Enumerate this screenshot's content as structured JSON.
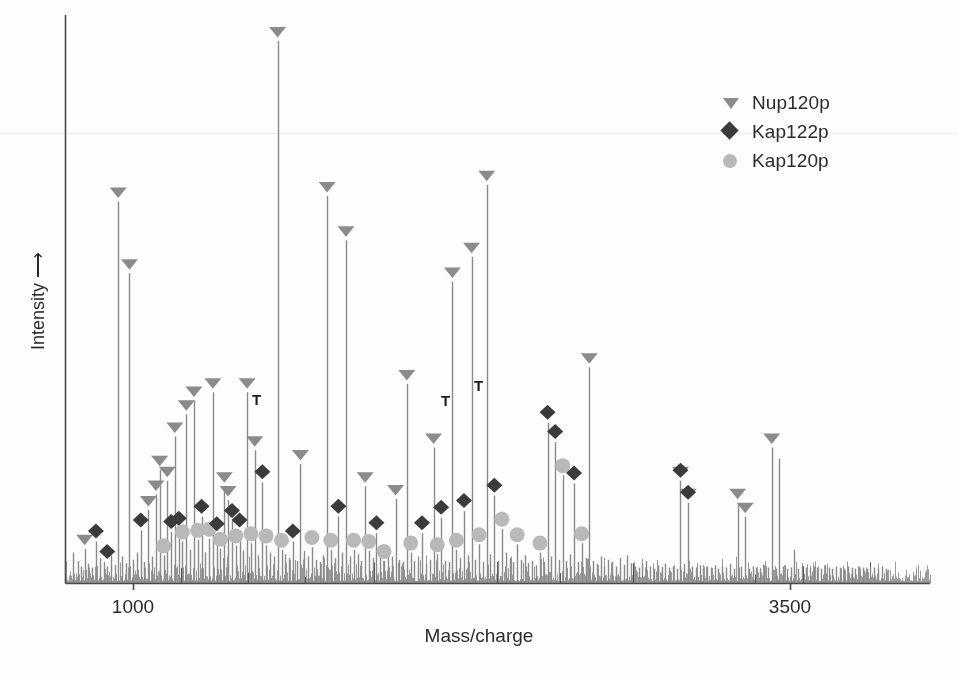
{
  "figure": {
    "background": "#fdfdfc",
    "axis_color": "#4a4a4a",
    "xlabel": "Mass/charge",
    "ylabel": "Intensity ⟶",
    "xticks": [
      {
        "label": "1000",
        "px": 133
      },
      {
        "label": "3500",
        "px": 790
      }
    ]
  },
  "legend": {
    "position": "top-right",
    "items": [
      {
        "label": "Nup120p",
        "marker": "triangle-down-icon",
        "color": "#8b8b8b"
      },
      {
        "label": "Kap122p",
        "marker": "diamond-icon",
        "color": "#3b3b3b"
      },
      {
        "label": "Kap120p",
        "marker": "circle-icon",
        "color": "#b9b9b9"
      }
    ]
  },
  "annotations": {
    "label": "T",
    "items": [
      {
        "text": "T",
        "x": 256,
        "y": 398
      },
      {
        "text": "T",
        "x": 445,
        "y": 399
      },
      {
        "text": "T",
        "x": 478,
        "y": 384
      }
    ]
  },
  "chart_data": {
    "type": "line",
    "title": "",
    "subtitle": "",
    "xlabel": "Mass/charge",
    "ylabel": "Intensity",
    "xlim": [
      800,
      4100
    ],
    "ylim": [
      0,
      1.0
    ],
    "grid": false,
    "legend_position": "top-right",
    "xtick_values": [
      1000,
      3500
    ],
    "xtick_labels": [
      "1000",
      "3500"
    ],
    "ytick_values": [],
    "series": [
      {
        "name": "spectrum",
        "color": "#8a8a8a",
        "note": "peaks given as [mass_charge, relative_intensity 0-1]",
        "peaks": [
          [
            830,
            0.055
          ],
          [
            848,
            0.04
          ],
          [
            862,
            0.03
          ],
          [
            875,
            0.062
          ],
          [
            889,
            0.035
          ],
          [
            903,
            0.028
          ],
          [
            918,
            0.075
          ],
          [
            932,
            0.045
          ],
          [
            947,
            0.038
          ],
          [
            961,
            0.03
          ],
          [
            975,
            0.05
          ],
          [
            990,
            0.033
          ],
          [
            1003,
            0.69
          ],
          [
            1018,
            0.048
          ],
          [
            1032,
            0.036
          ],
          [
            1046,
            0.56
          ],
          [
            1060,
            0.042
          ],
          [
            1075,
            0.055
          ],
          [
            1089,
            0.095
          ],
          [
            1103,
            0.038
          ],
          [
            1118,
            0.132
          ],
          [
            1132,
            0.048
          ],
          [
            1147,
            0.16
          ],
          [
            1161,
            0.205
          ],
          [
            1176,
            0.05
          ],
          [
            1190,
            0.185
          ],
          [
            1205,
            0.092
          ],
          [
            1219,
            0.265
          ],
          [
            1234,
            0.098
          ],
          [
            1248,
            0.075
          ],
          [
            1263,
            0.305
          ],
          [
            1277,
            0.06
          ],
          [
            1292,
            0.33
          ],
          [
            1306,
            0.078
          ],
          [
            1321,
            0.12
          ],
          [
            1335,
            0.055
          ],
          [
            1350,
            0.08
          ],
          [
            1364,
            0.345
          ],
          [
            1379,
            0.088
          ],
          [
            1393,
            0.062
          ],
          [
            1408,
            0.175
          ],
          [
            1422,
            0.15
          ],
          [
            1437,
            0.112
          ],
          [
            1451,
            0.068
          ],
          [
            1466,
            0.095
          ],
          [
            1480,
            0.058
          ],
          [
            1495,
            0.345
          ],
          [
            1509,
            0.072
          ],
          [
            1524,
            0.24
          ],
          [
            1538,
            0.05
          ],
          [
            1553,
            0.182
          ],
          [
            1567,
            0.068
          ],
          [
            1582,
            0.055
          ],
          [
            1596,
            0.048
          ],
          [
            1611,
            0.98
          ],
          [
            1626,
            0.06
          ],
          [
            1640,
            0.052
          ],
          [
            1655,
            0.045
          ],
          [
            1669,
            0.075
          ],
          [
            1684,
            0.04
          ],
          [
            1698,
            0.215
          ],
          [
            1713,
            0.058
          ],
          [
            1727,
            0.048
          ],
          [
            1742,
            0.065
          ],
          [
            1756,
            0.042
          ],
          [
            1771,
            0.038
          ],
          [
            1785,
            0.05
          ],
          [
            1800,
            0.7
          ],
          [
            1814,
            0.06
          ],
          [
            1829,
            0.045
          ],
          [
            1843,
            0.12
          ],
          [
            1858,
            0.055
          ],
          [
            1872,
            0.62
          ],
          [
            1887,
            0.048
          ],
          [
            1901,
            0.06
          ],
          [
            1916,
            0.052
          ],
          [
            1930,
            0.04
          ],
          [
            1945,
            0.175
          ],
          [
            1959,
            0.058
          ],
          [
            1974,
            0.045
          ],
          [
            1988,
            0.09
          ],
          [
            2003,
            0.05
          ],
          [
            2017,
            0.04
          ],
          [
            2032,
            0.06
          ],
          [
            2046,
            0.048
          ],
          [
            2061,
            0.152
          ],
          [
            2075,
            0.042
          ],
          [
            2090,
            0.038
          ],
          [
            2104,
            0.36
          ],
          [
            2119,
            0.055
          ],
          [
            2133,
            0.04
          ],
          [
            2148,
            0.048
          ],
          [
            2162,
            0.09
          ],
          [
            2177,
            0.035
          ],
          [
            2191,
            0.042
          ],
          [
            2206,
            0.245
          ],
          [
            2220,
            0.052
          ],
          [
            2235,
            0.118
          ],
          [
            2249,
            0.04
          ],
          [
            2264,
            0.038
          ],
          [
            2278,
            0.545
          ],
          [
            2293,
            0.06
          ],
          [
            2307,
            0.045
          ],
          [
            2322,
            0.13
          ],
          [
            2336,
            0.05
          ],
          [
            2351,
            0.59
          ],
          [
            2365,
            0.042
          ],
          [
            2380,
            0.07
          ],
          [
            2394,
            0.038
          ],
          [
            2409,
            0.72
          ],
          [
            2423,
            0.052
          ],
          [
            2438,
            0.158
          ],
          [
            2452,
            0.04
          ],
          [
            2467,
            0.098
          ],
          [
            2481,
            0.055
          ],
          [
            2496,
            0.045
          ],
          [
            2510,
            0.038
          ],
          [
            2525,
            0.07
          ],
          [
            2539,
            0.042
          ],
          [
            2554,
            0.05
          ],
          [
            2568,
            0.036
          ],
          [
            2583,
            0.04
          ],
          [
            2597,
            0.032
          ],
          [
            2612,
            0.055
          ],
          [
            2626,
            0.038
          ],
          [
            2641,
            0.29
          ],
          [
            2655,
            0.048
          ],
          [
            2670,
            0.255
          ],
          [
            2684,
            0.042
          ],
          [
            2699,
            0.195
          ],
          [
            2713,
            0.04
          ],
          [
            2728,
            0.052
          ],
          [
            2742,
            0.18
          ],
          [
            2757,
            0.038
          ],
          [
            2771,
            0.072
          ],
          [
            2786,
            0.045
          ],
          [
            2800,
            0.39
          ],
          [
            2815,
            0.04
          ],
          [
            2829,
            0.035
          ],
          [
            2844,
            0.048
          ],
          [
            2858,
            0.03
          ],
          [
            2873,
            0.042
          ],
          [
            2887,
            0.038
          ],
          [
            2902,
            0.03
          ],
          [
            2916,
            0.045
          ],
          [
            2931,
            0.033
          ],
          [
            2945,
            0.05
          ],
          [
            2960,
            0.036
          ],
          [
            2974,
            0.03
          ],
          [
            2989,
            0.028
          ],
          [
            3003,
            0.035
          ],
          [
            3018,
            0.04
          ],
          [
            3032,
            0.03
          ],
          [
            3047,
            0.026
          ],
          [
            3061,
            0.032
          ],
          [
            3076,
            0.029
          ],
          [
            3090,
            0.035
          ],
          [
            3105,
            0.028
          ],
          [
            3119,
            0.03
          ],
          [
            3134,
            0.026
          ],
          [
            3148,
            0.185
          ],
          [
            3163,
            0.035
          ],
          [
            3177,
            0.145
          ],
          [
            3192,
            0.03
          ],
          [
            3206,
            0.028
          ],
          [
            3221,
            0.032
          ],
          [
            3235,
            0.026
          ],
          [
            3250,
            0.03
          ],
          [
            3264,
            0.028
          ],
          [
            3279,
            0.032
          ],
          [
            3293,
            0.026
          ],
          [
            3308,
            0.03
          ],
          [
            3322,
            0.028
          ],
          [
            3337,
            0.035
          ],
          [
            3351,
            0.026
          ],
          [
            3366,
            0.145
          ],
          [
            3380,
            0.03
          ],
          [
            3395,
            0.12
          ],
          [
            3409,
            0.026
          ],
          [
            3424,
            0.03
          ],
          [
            3438,
            0.028
          ],
          [
            3453,
            0.026
          ],
          [
            3467,
            0.03
          ],
          [
            3482,
            0.028
          ],
          [
            3496,
            0.245
          ],
          [
            3511,
            0.026
          ],
          [
            3525,
            0.225
          ],
          [
            3540,
            0.03
          ],
          [
            3554,
            0.026
          ],
          [
            3569,
            0.028
          ],
          [
            3583,
            0.06
          ],
          [
            3598,
            0.026
          ],
          [
            3612,
            0.03
          ],
          [
            3627,
            0.028
          ],
          [
            3641,
            0.026
          ],
          [
            3656,
            0.03
          ],
          [
            3670,
            0.028
          ],
          [
            3685,
            0.026
          ],
          [
            3699,
            0.03
          ],
          [
            3714,
            0.028
          ],
          [
            3728,
            0.026
          ],
          [
            3743,
            0.03
          ],
          [
            3757,
            0.028
          ],
          [
            3772,
            0.026
          ],
          [
            3786,
            0.03
          ],
          [
            3801,
            0.028
          ],
          [
            3815,
            0.026
          ],
          [
            3830,
            0.03
          ],
          [
            3844,
            0.028
          ],
          [
            3859,
            0.026
          ],
          [
            3873,
            0.03
          ],
          [
            3888,
            0.028
          ],
          [
            3902,
            0.026
          ],
          [
            3917,
            0.03
          ],
          [
            3931,
            0.026
          ]
        ]
      }
    ],
    "markers": {
      "Nup120p": {
        "shape": "triangle-down-icon",
        "color": "#8b8b8b",
        "points": [
          [
            875,
            0.062
          ],
          [
            1003,
            0.69
          ],
          [
            1046,
            0.56
          ],
          [
            1118,
            0.132
          ],
          [
            1147,
            0.16
          ],
          [
            1161,
            0.205
          ],
          [
            1190,
            0.185
          ],
          [
            1219,
            0.265
          ],
          [
            1263,
            0.305
          ],
          [
            1292,
            0.33
          ],
          [
            1364,
            0.345
          ],
          [
            1408,
            0.175
          ],
          [
            1422,
            0.15
          ],
          [
            1495,
            0.345
          ],
          [
            1524,
            0.24
          ],
          [
            1611,
            0.98
          ],
          [
            1698,
            0.215
          ],
          [
            1800,
            0.7
          ],
          [
            1872,
            0.62
          ],
          [
            1945,
            0.175
          ],
          [
            2061,
            0.152
          ],
          [
            2104,
            0.36
          ],
          [
            2206,
            0.245
          ],
          [
            2278,
            0.545
          ],
          [
            2351,
            0.59
          ],
          [
            2409,
            0.72
          ],
          [
            2800,
            0.39
          ],
          [
            3148,
            0.185
          ],
          [
            3177,
            0.145
          ],
          [
            3366,
            0.145
          ],
          [
            3395,
            0.12
          ],
          [
            3496,
            0.245
          ]
        ]
      },
      "Kap122p": {
        "shape": "diamond-icon",
        "color": "#3b3b3b",
        "points": [
          [
            918,
            0.075
          ],
          [
            961,
            0.038
          ],
          [
            1089,
            0.095
          ],
          [
            1205,
            0.092
          ],
          [
            1234,
            0.098
          ],
          [
            1321,
            0.12
          ],
          [
            1379,
            0.088
          ],
          [
            1437,
            0.112
          ],
          [
            1466,
            0.095
          ],
          [
            1553,
            0.182
          ],
          [
            1669,
            0.075
          ],
          [
            1843,
            0.12
          ],
          [
            1988,
            0.09
          ],
          [
            2162,
            0.09
          ],
          [
            2235,
            0.118
          ],
          [
            2322,
            0.13
          ],
          [
            2438,
            0.158
          ],
          [
            2641,
            0.29
          ],
          [
            2670,
            0.255
          ],
          [
            2742,
            0.18
          ],
          [
            3148,
            0.185
          ],
          [
            3177,
            0.145
          ]
        ]
      },
      "Kap120p": {
        "shape": "circle-icon",
        "color": "#b9b9b9",
        "points": [
          [
            1176,
            0.05
          ],
          [
            1248,
            0.075
          ],
          [
            1306,
            0.078
          ],
          [
            1350,
            0.08
          ],
          [
            1393,
            0.062
          ],
          [
            1451,
            0.068
          ],
          [
            1509,
            0.072
          ],
          [
            1567,
            0.068
          ],
          [
            1626,
            0.06
          ],
          [
            1742,
            0.065
          ],
          [
            1814,
            0.06
          ],
          [
            1901,
            0.06
          ],
          [
            1959,
            0.058
          ],
          [
            2017,
            0.04
          ],
          [
            2119,
            0.055
          ],
          [
            2220,
            0.052
          ],
          [
            2293,
            0.06
          ],
          [
            2380,
            0.07
          ],
          [
            2467,
            0.098
          ],
          [
            2525,
            0.07
          ],
          [
            2612,
            0.055
          ],
          [
            2699,
            0.195
          ],
          [
            2771,
            0.072
          ]
        ]
      }
    }
  }
}
